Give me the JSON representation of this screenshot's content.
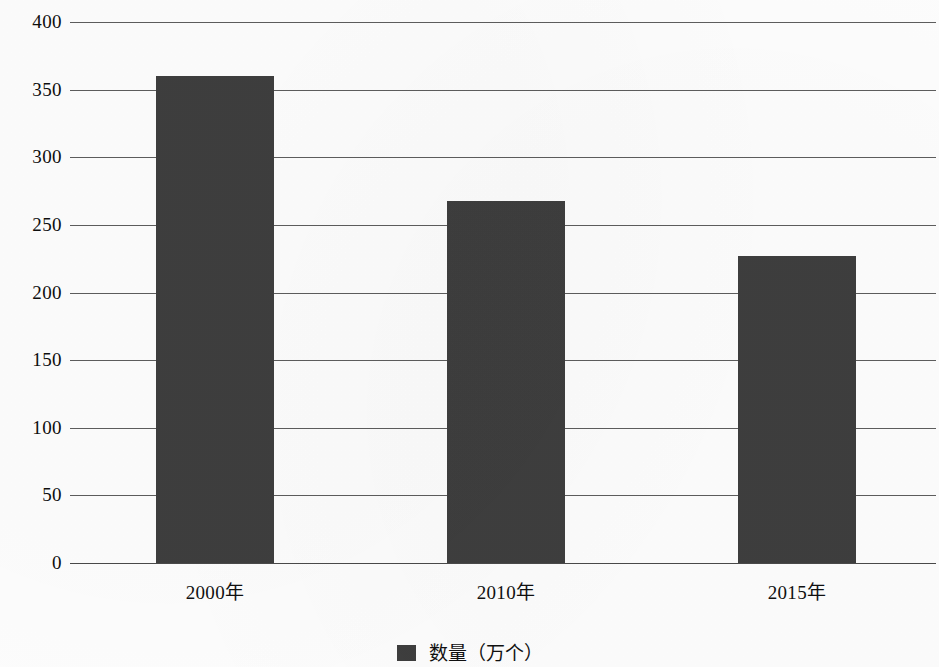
{
  "chart_data": {
    "type": "bar",
    "title": "",
    "subtitle": "",
    "xlabel": "",
    "ylabel": "",
    "categories": [
      "2000年",
      "2010年",
      "2015年"
    ],
    "values": [
      360,
      268,
      227
    ],
    "series": [
      {
        "name": "数量（万个）",
        "values": [
          360,
          268,
          227
        ],
        "color": "#3e3e3e"
      }
    ],
    "ylim": [
      0,
      400
    ],
    "ytick_values": [
      0,
      50,
      100,
      150,
      200,
      250,
      300,
      350,
      400
    ],
    "ytick_labels": [
      "0",
      "50",
      "100",
      "150",
      "200",
      "250",
      "300",
      "350",
      "400"
    ],
    "grid": true,
    "grid_axis": "y",
    "legend": {
      "position": "bottom-center",
      "entries": [
        {
          "label": "数量（万个）",
          "color": "#3e3e3e"
        }
      ]
    },
    "annotations": []
  },
  "colors": {
    "bar": "#3e3e3e",
    "gridline": "#5d5d5d",
    "text": "#101010",
    "background": "#fdfdfd"
  }
}
